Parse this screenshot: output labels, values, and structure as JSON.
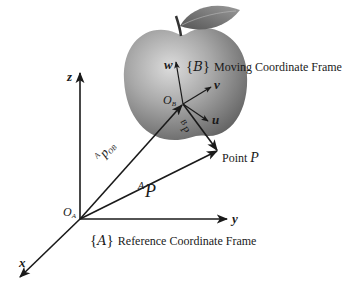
{
  "diagram": {
    "reference_frame": {
      "brace_open": "{",
      "symbol": "A",
      "brace_close": "}",
      "label": "Reference Coordinate Frame",
      "origin_label": "O",
      "origin_sub": "A",
      "axes": {
        "x": "x",
        "y": "y",
        "z": "z"
      }
    },
    "moving_frame": {
      "brace_open": "{",
      "symbol": "B",
      "brace_close": "}",
      "label": "Moving Coordinate Frame",
      "origin_label": "O",
      "origin_sub": "B",
      "axes": {
        "u": "u",
        "v": "v",
        "w": "w"
      }
    },
    "vectors": {
      "ApOB": {
        "sup": "A",
        "main": "p",
        "sub": "OB"
      },
      "AP": {
        "sup": "A",
        "main": "P"
      },
      "BP": {
        "sup": "B",
        "main": "P"
      }
    },
    "point": {
      "prefix": "Point ",
      "name": "P"
    },
    "colors": {
      "line": "#1a1a1a",
      "apple_light": "#c9c9c9",
      "apple_dark": "#6e6e6e",
      "leaf": "#7a7a7a"
    }
  }
}
